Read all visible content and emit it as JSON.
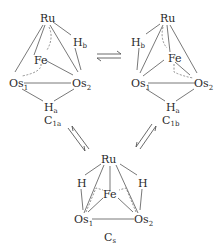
{
  "structures": {
    "c1a": {
      "label": "C",
      "label_sub": "1a",
      "atoms": {
        "ru": "Ru",
        "fe": "Fe",
        "os1": "Os",
        "os1_sub": "1",
        "os2": "Os",
        "os2_sub": "2",
        "hb": "H",
        "hb_sub": "b",
        "ha": "H",
        "ha_sub": "a"
      }
    },
    "c1b": {
      "label": "C",
      "label_sub": "1b",
      "atoms": {
        "ru": "Ru",
        "fe": "Fe",
        "os1": "Os",
        "os1_sub": "1",
        "os2": "Os",
        "os2_sub": "2",
        "hb": "H",
        "hb_sub": "b",
        "ha": "H",
        "ha_sub": "a"
      }
    },
    "cs": {
      "label": "C",
      "label_sub": "s",
      "atoms": {
        "ru": "Ru",
        "fe": "Fe",
        "os1": "Os",
        "os1_sub": "1",
        "os2": "Os",
        "os2_sub": "2",
        "h_left": "H",
        "h_right": "H"
      }
    }
  },
  "equilibria": [
    {
      "from": "c1a",
      "to": "c1b",
      "type": "equilibrium-arrows"
    },
    {
      "from": "c1a",
      "to": "cs",
      "type": "equilibrium-arrows"
    },
    {
      "from": "c1b",
      "to": "cs",
      "type": "equilibrium-arrows"
    }
  ]
}
